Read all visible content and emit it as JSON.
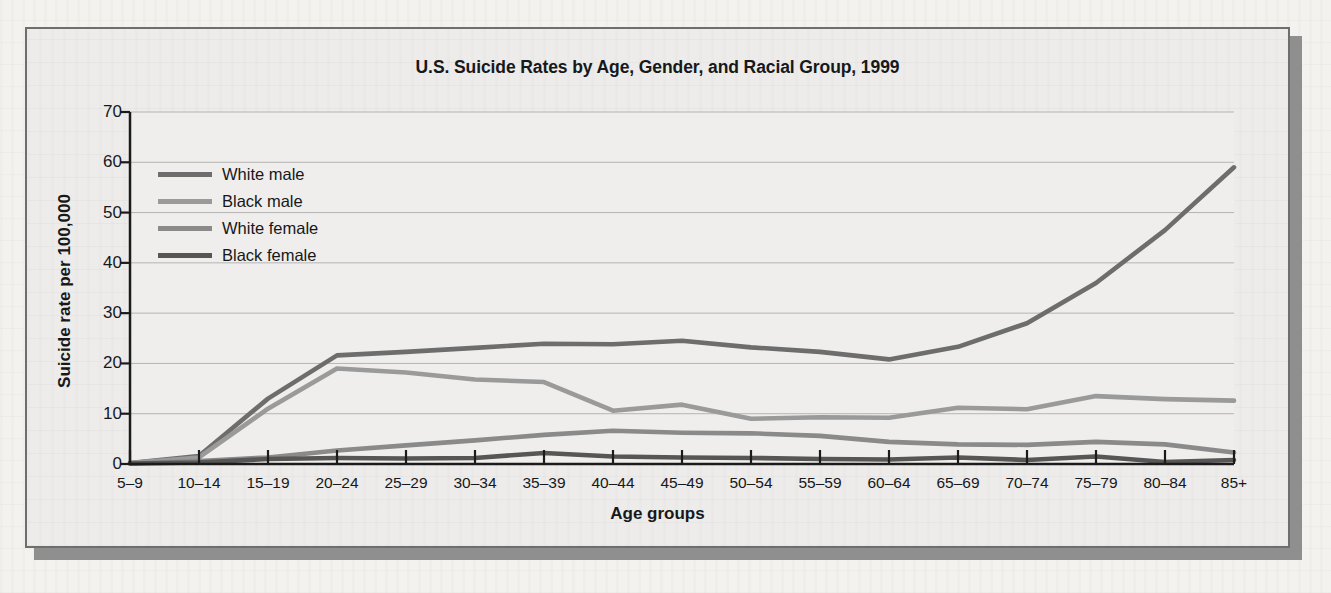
{
  "chart_data": {
    "type": "line",
    "title": "U.S. Suicide Rates by Age, Gender, and Racial Group, 1999",
    "xlabel": "Age groups",
    "ylabel": "Suicide rate per 100,000",
    "ylim": [
      0,
      70
    ],
    "yticks": [
      0,
      10,
      20,
      30,
      40,
      50,
      60,
      70
    ],
    "grid": true,
    "legend_position": "upper-left inside plot",
    "categories": [
      "5–9",
      "10–14",
      "15–19",
      "20–24",
      "25–29",
      "30–34",
      "35–39",
      "40–44",
      "45–49",
      "50–54",
      "55–59",
      "60–64",
      "65–69",
      "70–74",
      "75–79",
      "80–84",
      "85+"
    ],
    "series": [
      {
        "name": "White male",
        "color": "#6d6d6d",
        "values": [
          0.2,
          1.6,
          13.0,
          21.6,
          22.3,
          23.1,
          23.9,
          23.8,
          24.5,
          23.2,
          22.3,
          20.8,
          23.3,
          28.0,
          36.0,
          46.5,
          59.0
        ]
      },
      {
        "name": "Black male",
        "color": "#9a9a9a",
        "values": [
          0.2,
          1.3,
          11.0,
          19.0,
          18.2,
          16.8,
          16.3,
          10.6,
          11.8,
          9.0,
          9.3,
          9.2,
          11.2,
          10.9,
          13.5,
          12.9,
          12.6
        ]
      },
      {
        "name": "White female",
        "color": "#8a8a8a",
        "values": [
          0.1,
          0.6,
          1.3,
          2.7,
          3.7,
          4.7,
          5.8,
          6.6,
          6.2,
          6.1,
          5.6,
          4.4,
          3.9,
          3.8,
          4.4,
          3.9,
          2.3
        ]
      },
      {
        "name": "Black female",
        "color": "#565656",
        "values": [
          0.1,
          0.3,
          1.0,
          1.2,
          1.1,
          1.2,
          2.2,
          1.5,
          1.3,
          1.2,
          1.0,
          0.9,
          1.3,
          0.8,
          1.5,
          0.4,
          0.8
        ]
      }
    ]
  },
  "style": {
    "gridline_color": "#b4b4b4",
    "axis_color": "#1b1b1b",
    "plot_background": "#efeeec",
    "figure_background": "#edecea",
    "figure_border": "#6e6e6e"
  }
}
